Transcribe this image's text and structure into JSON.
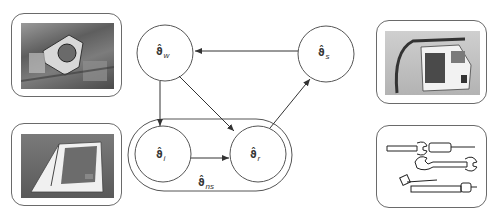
{
  "diagram": {
    "nodes": [
      {
        "id": "w",
        "symbol": "ϑ̂",
        "subscript": "w",
        "cx": 165,
        "cy": 53,
        "r": 28
      },
      {
        "id": "s",
        "symbol": "ϑ̂",
        "subscript": "s",
        "cx": 326,
        "cy": 54,
        "r": 28
      },
      {
        "id": "i",
        "symbol": "ϑ̂",
        "subscript": "i",
        "cx": 163,
        "cy": 154,
        "r": 28
      },
      {
        "id": "r",
        "symbol": "ϑ̂",
        "subscript": "r",
        "cx": 258,
        "cy": 154,
        "r": 28
      }
    ],
    "group": {
      "id": "ns",
      "symbol": "ϑ̂",
      "subscript": "ns",
      "contains": [
        "i",
        "r"
      ]
    },
    "edges": [
      {
        "from": "s",
        "to": "w"
      },
      {
        "from": "w",
        "to": "i"
      },
      {
        "from": "w",
        "to": "r"
      },
      {
        "from": "i",
        "to": "r"
      },
      {
        "from": "r",
        "to": "s"
      }
    ]
  },
  "panels": [
    {
      "id": "top-left",
      "content": "photo-industrial-machine-interior"
    },
    {
      "id": "bottom-left",
      "content": "photo-white-vehicle-cab"
    },
    {
      "id": "top-right",
      "content": "photo-cab-assembly-with-frame"
    },
    {
      "id": "bottom-right",
      "content": "drawing-hand-tools-wrenches-screwdriver"
    }
  ],
  "colors": {
    "stroke": "#555555",
    "frame": "#6a6a6a",
    "text": "#333333"
  }
}
